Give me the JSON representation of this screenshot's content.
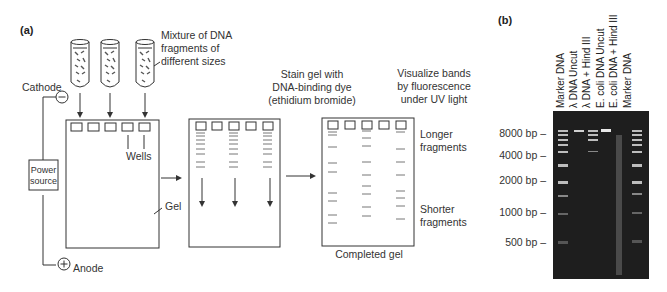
{
  "figure": {
    "panel_a": {
      "label": "(a)",
      "mixture_label": [
        "Mixture of DNA",
        "fragments of",
        "different sizes"
      ],
      "cathode_label": "Cathode",
      "cathode_symbol": "−",
      "anode_label": "Anode",
      "anode_symbol": "+",
      "power_source_label": [
        "Power",
        "source"
      ],
      "wells_label": "Wells",
      "gel_label": "Gel",
      "stain_label": [
        "Stain gel with",
        "DNA-binding dye",
        "(ethidium bromide)"
      ],
      "visualize_label": [
        "Visualize bands",
        "by fluorescence",
        "under UV light"
      ],
      "longer_label": [
        "Longer",
        "fragments"
      ],
      "shorter_label": [
        "Shorter",
        "fragments"
      ],
      "completed_label": "Completed gel"
    },
    "panel_b": {
      "label": "(b)",
      "lanes": [
        "Marker DNA",
        "λ DNA Uncut",
        "λ DNA + Hind III",
        "E. coli DNA Uncut",
        "E. coli DNA + Hind III",
        "Marker DNA"
      ],
      "size_markers": [
        "8000 bp –",
        "4000 bp –",
        "2000 bp –",
        "1000 bp –",
        "500 bp –"
      ],
      "gel_color": "#1e1e1e"
    }
  }
}
